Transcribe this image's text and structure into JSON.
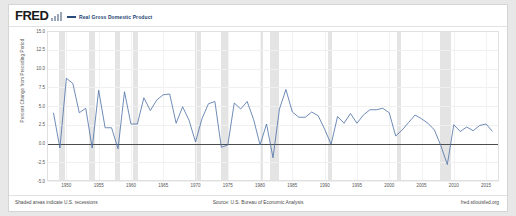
{
  "header": {
    "logo_text": "FRED",
    "logo_mark_icon": "bar-chart-icon",
    "legend_label": "Real Gross Domestic Product",
    "legend_color": "#2b4a7d"
  },
  "footer": {
    "note": "Shaded areas indicate U.S. recessions",
    "source": "Source: U.S. Bureau of Economic Analysis",
    "url": "fred.stlouisfed.org"
  },
  "chart_data": {
    "type": "line",
    "title": "Real Gross Domestic Product",
    "xlabel": "",
    "ylabel": "Percent Change from Preceding Period",
    "xlim": [
      1947,
      2017
    ],
    "ylim": [
      -5.0,
      15.0
    ],
    "grid": true,
    "legend_position": "top",
    "ytick_labels": [
      "15.0",
      "12.5",
      "10.0",
      "7.5",
      "5.0",
      "2.5",
      "0.0",
      "-2.5",
      "-5.0"
    ],
    "ytick_values": [
      15.0,
      12.5,
      10.0,
      7.5,
      5.0,
      2.5,
      0.0,
      -2.5,
      -5.0
    ],
    "xtick_labels": [
      "1950",
      "1955",
      "1960",
      "1965",
      "1970",
      "1975",
      "1980",
      "1985",
      "1990",
      "1995",
      "2000",
      "2005",
      "2010",
      "2015"
    ],
    "xtick_values": [
      1950,
      1955,
      1960,
      1965,
      1970,
      1975,
      1980,
      1985,
      1990,
      1995,
      2000,
      2005,
      2010,
      2015
    ],
    "series": [
      {
        "name": "Real Gross Domestic Product",
        "color": "#4a6fa5",
        "x": [
          1948,
          1949,
          1950,
          1951,
          1952,
          1953,
          1954,
          1955,
          1956,
          1957,
          1958,
          1959,
          1960,
          1961,
          1962,
          1963,
          1964,
          1965,
          1966,
          1967,
          1968,
          1969,
          1970,
          1971,
          1972,
          1973,
          1974,
          1975,
          1976,
          1977,
          1978,
          1979,
          1980,
          1981,
          1982,
          1983,
          1984,
          1985,
          1986,
          1987,
          1988,
          1989,
          1990,
          1991,
          1992,
          1993,
          1994,
          1995,
          1996,
          1997,
          1998,
          1999,
          2000,
          2001,
          2002,
          2003,
          2004,
          2005,
          2006,
          2007,
          2008,
          2009,
          2010,
          2011,
          2012,
          2013,
          2014,
          2015,
          2016
        ],
        "values": [
          4.1,
          -0.6,
          8.7,
          8.0,
          4.1,
          4.7,
          -0.6,
          7.1,
          2.1,
          2.1,
          -0.7,
          6.9,
          2.6,
          2.6,
          6.1,
          4.4,
          5.8,
          6.5,
          6.6,
          2.7,
          4.9,
          3.1,
          0.2,
          3.3,
          5.3,
          5.6,
          -0.5,
          -0.2,
          5.4,
          4.6,
          5.6,
          3.2,
          -0.2,
          2.6,
          -1.9,
          4.6,
          7.2,
          4.2,
          3.5,
          3.5,
          4.2,
          3.7,
          1.9,
          -0.1,
          3.6,
          2.7,
          4.0,
          2.7,
          3.8,
          4.5,
          4.5,
          4.7,
          4.1,
          1.0,
          1.8,
          2.8,
          3.8,
          3.3,
          2.7,
          1.8,
          -0.3,
          -2.8,
          2.5,
          1.6,
          2.2,
          1.7,
          2.4,
          2.6,
          1.6
        ]
      }
    ],
    "recessions": [
      {
        "start": 1948.9,
        "end": 1949.8
      },
      {
        "start": 1953.5,
        "end": 1954.4
      },
      {
        "start": 1957.6,
        "end": 1958.3
      },
      {
        "start": 1960.3,
        "end": 1961.1
      },
      {
        "start": 1969.9,
        "end": 1970.9
      },
      {
        "start": 1973.9,
        "end": 1975.2
      },
      {
        "start": 1980.0,
        "end": 1980.5
      },
      {
        "start": 1981.5,
        "end": 1982.9
      },
      {
        "start": 1990.5,
        "end": 1991.2
      },
      {
        "start": 2001.2,
        "end": 2001.9
      },
      {
        "start": 2007.9,
        "end": 2009.5
      }
    ]
  }
}
